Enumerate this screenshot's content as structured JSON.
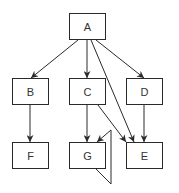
{
  "diagram": {
    "type": "directed-graph",
    "colors": {
      "stroke": "#2a2a2a",
      "text": "#333333",
      "background": "#ffffff"
    },
    "nodes": [
      {
        "id": "A",
        "label": "A",
        "x": 69,
        "y": 13,
        "w": 37,
        "h": 27
      },
      {
        "id": "B",
        "label": "B",
        "x": 12,
        "y": 78,
        "w": 37,
        "h": 27
      },
      {
        "id": "C",
        "label": "C",
        "x": 69,
        "y": 78,
        "w": 37,
        "h": 27
      },
      {
        "id": "D",
        "label": "D",
        "x": 126,
        "y": 78,
        "w": 37,
        "h": 27
      },
      {
        "id": "F",
        "label": "F",
        "x": 12,
        "y": 142,
        "w": 37,
        "h": 27
      },
      {
        "id": "G",
        "label": "G",
        "x": 69,
        "y": 142,
        "w": 37,
        "h": 27
      },
      {
        "id": "E",
        "label": "E",
        "x": 126,
        "y": 142,
        "w": 37,
        "h": 27
      }
    ],
    "edges": [
      {
        "from": "A",
        "to": "B"
      },
      {
        "from": "A",
        "to": "C"
      },
      {
        "from": "A",
        "to": "D"
      },
      {
        "from": "A",
        "to": "E"
      },
      {
        "from": "B",
        "to": "F"
      },
      {
        "from": "C",
        "to": "G"
      },
      {
        "from": "C",
        "to": "E"
      },
      {
        "from": "D",
        "to": "E"
      },
      {
        "from": "G",
        "to": "G",
        "kind": "self-loop"
      }
    ]
  }
}
